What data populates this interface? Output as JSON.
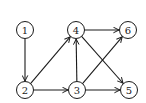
{
  "diagram": {
    "type": "directed-graph",
    "node_radius": 8.5,
    "colors": {
      "stroke": "#1a1a1a",
      "fill": "#ffffff",
      "background": "#ffffff"
    },
    "nodes": [
      {
        "id": "1",
        "label": "1",
        "x": 25,
        "y": 30
      },
      {
        "id": "2",
        "label": "2",
        "x": 25,
        "y": 90
      },
      {
        "id": "3",
        "label": "3",
        "x": 77,
        "y": 90
      },
      {
        "id": "4",
        "label": "4",
        "x": 76,
        "y": 30
      },
      {
        "id": "5",
        "label": "5",
        "x": 129,
        "y": 90
      },
      {
        "id": "6",
        "label": "6",
        "x": 128,
        "y": 30
      }
    ],
    "edges": [
      {
        "from": "1",
        "to": "2"
      },
      {
        "from": "2",
        "to": "4"
      },
      {
        "from": "2",
        "to": "3"
      },
      {
        "from": "3",
        "to": "4"
      },
      {
        "from": "3",
        "to": "6"
      },
      {
        "from": "3",
        "to": "5"
      },
      {
        "from": "4",
        "to": "6"
      },
      {
        "from": "4",
        "to": "5"
      }
    ]
  }
}
